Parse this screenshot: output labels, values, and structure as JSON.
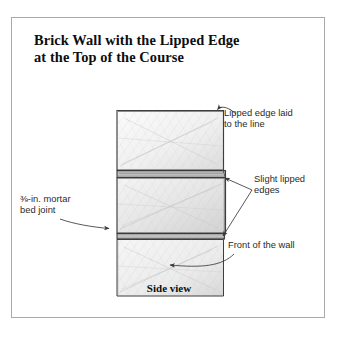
{
  "figure": {
    "title_line1": "Brick Wall with the Lipped Edge",
    "title_line2": "at the Top of the Course",
    "caption": "Side view",
    "border_color": "#a9a9a9",
    "background_color": "#ffffff",
    "ink_color": "#2b2b2b"
  },
  "annotations": {
    "lipped_edge_laid": "Lipped edge laid\nto the line",
    "slight_lipped_edges": "Slight lipped\nedges",
    "front_of_the_wall": "Front of the wall",
    "mortar_bed_joint": "⅜-in. mortar\nbed joint"
  },
  "drawing": {
    "type": "line-drawing",
    "subject": "brick-wall-side-view",
    "bricks": [
      {
        "name": "top-brick",
        "x": 105,
        "y": 92,
        "width": 107,
        "height": 60
      },
      {
        "name": "middle-brick",
        "x": 105,
        "y": 160,
        "width": 109,
        "height": 55
      },
      {
        "name": "bottom-brick",
        "x": 105,
        "y": 221,
        "width": 107,
        "height": 57
      }
    ],
    "mortar_joints": [
      {
        "name": "upper-mortar-joint",
        "x": 105,
        "y": 152,
        "width": 107,
        "height": 8
      },
      {
        "name": "lower-mortar-joint",
        "x": 105,
        "y": 215,
        "width": 109,
        "height": 6
      }
    ]
  }
}
